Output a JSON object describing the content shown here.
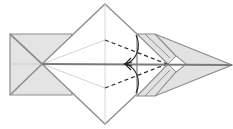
{
  "diagram": {
    "type": "origami-fold-step",
    "colors": {
      "paper_shade": "#e4e4e4",
      "paper_white": "#ffffff",
      "edge": "#8c8c8c",
      "crease": "#c8c8c8",
      "valley_fold": "#2a2a2a",
      "arrow": "#222222",
      "center_line": "#7a7a7a"
    },
    "elements": {
      "left_flap": "shaded rectangle with X creases",
      "center_diamond": "white square rotated 45deg",
      "right_point": "shaded folded point layers",
      "valley_folds": 2,
      "fold_arrows": 2
    }
  }
}
